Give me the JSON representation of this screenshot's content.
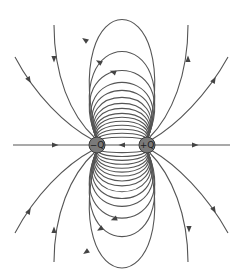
{
  "diagram": {
    "charges": [
      {
        "id": "negative",
        "label": "−Q",
        "x": 97,
        "y": 145,
        "r": 8,
        "sign": "-"
      },
      {
        "id": "positive",
        "label": "+Q",
        "x": 147,
        "y": 145,
        "r": 8,
        "sign": "+"
      }
    ],
    "field_line_direction": "from +Q to −Q",
    "axis": {
      "y": 145,
      "x_start": 13,
      "x_end": 230
    },
    "colors": {
      "line": "#555555",
      "arrow": "#444444",
      "charge_fill": "#7a7a7a",
      "charge_stroke": "#3a3a3a",
      "background": "#ffffff"
    },
    "loop_peaks_offset": [
      125,
      93,
      74,
      62,
      54,
      47,
      41,
      36,
      31,
      27,
      23,
      19,
      15,
      11,
      7
    ]
  }
}
